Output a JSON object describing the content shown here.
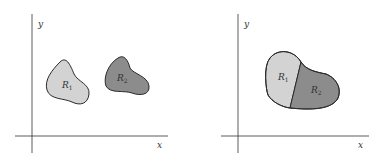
{
  "left_panel": {
    "axis_x": "x",
    "axis_y": "y",
    "region1": {
      "name": "R",
      "sub": "1",
      "color": "#d3d3d3"
    },
    "region2": {
      "name": "R",
      "sub": "2",
      "color": "#8c8c8c"
    }
  },
  "right_panel": {
    "axis_x": "x",
    "axis_y": "y",
    "region1": {
      "name": "R",
      "sub": "1",
      "color": "#d3d3d3"
    },
    "region2": {
      "name": "R",
      "sub": "2",
      "color": "#8c8c8c"
    }
  },
  "colors": {
    "axis": "#333333",
    "outline": "#2a2a2a"
  }
}
